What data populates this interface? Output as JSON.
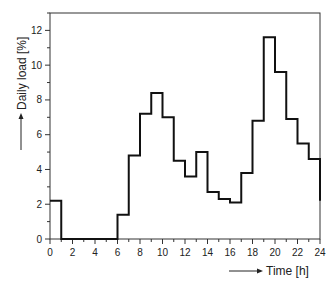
{
  "chart_data": {
    "type": "step",
    "title": "",
    "xlabel": "Time [h]",
    "ylabel": "Daily load [%]",
    "xlim": [
      0,
      24
    ],
    "ylim": [
      0,
      13
    ],
    "xticks": [
      0,
      2,
      4,
      6,
      8,
      10,
      12,
      14,
      16,
      18,
      20,
      22,
      24
    ],
    "yticks": [
      0,
      2,
      4,
      6,
      8,
      10,
      12
    ],
    "x_minor_step": 1,
    "y_minor_step": 1,
    "grid": false,
    "legend": null,
    "series": [
      {
        "name": "Daily load",
        "hour_start": [
          0,
          1,
          2,
          3,
          4,
          5,
          6,
          7,
          8,
          9,
          10,
          11,
          12,
          13,
          14,
          15,
          16,
          17,
          18,
          19,
          20,
          21,
          22,
          23
        ],
        "values": [
          2.2,
          0,
          0,
          0,
          0,
          0,
          1.4,
          4.8,
          7.2,
          8.4,
          7.0,
          4.5,
          3.6,
          5.0,
          2.7,
          2.3,
          2.1,
          3.8,
          6.8,
          11.6,
          9.6,
          6.9,
          5.5,
          4.6
        ],
        "end_value": 2.2
      }
    ]
  },
  "axes": {
    "xlabel": "Time [h]",
    "ylabel": "Daily load [%]"
  }
}
